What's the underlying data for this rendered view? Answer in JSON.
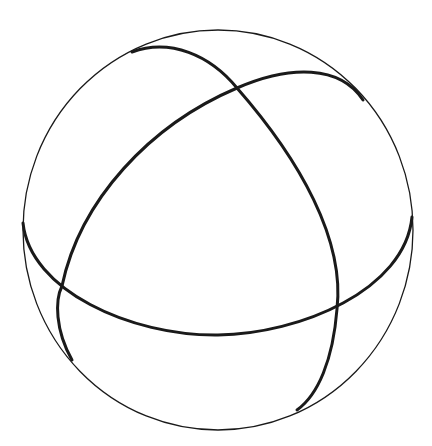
{
  "diagram": {
    "colors": {
      "background": "#ffffff",
      "stroke": "#1a1a1a"
    },
    "sphere": {
      "cx": 218,
      "cy": 230,
      "rx": 195,
      "ry": 200
    },
    "arcs": [
      {
        "name": "equator",
        "path": "M23,223 C30,290 130,336 218,335 C300,334 405,290 412,217"
      },
      {
        "name": "arc-top-left-to-bottom-right",
        "path": "M132,52 C170,38 210,55 237,88 C300,160 345,240 337,309 C333,360 318,395 297,410"
      },
      {
        "name": "arc-bottom-left-to-top-right",
        "path": "M72,360 C55,330 55,300 62,286 C80,200 150,125 237,88 C290,65 340,65 363,100"
      }
    ]
  }
}
